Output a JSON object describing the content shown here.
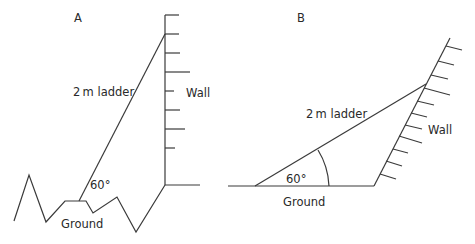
{
  "figure": {
    "panels": [
      {
        "id": "A",
        "label": "A",
        "ladder_label": "2 m ladder",
        "wall_label": "Wall",
        "ground_label": "Ground",
        "angle_label": "60°",
        "description": "Vertical wall, ladder on uneven ground"
      },
      {
        "id": "B",
        "label": "B",
        "ladder_label": "2 m ladder",
        "wall_label": "Wall",
        "ground_label": "Ground",
        "angle_label": "60°",
        "description": "Sloping wall, ladder on flat ground with angle arc"
      }
    ],
    "ladder_length_m": 2,
    "angle_deg": 60
  }
}
